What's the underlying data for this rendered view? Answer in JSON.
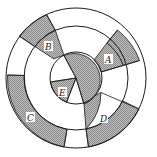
{
  "diagram": {
    "type": "concentric-ring-sector-diagram",
    "center": [
      76,
      78
    ],
    "radii": {
      "outer": 70,
      "middle": 52,
      "inner": 26
    },
    "colors": {
      "shaded": "#a8a8a8",
      "unshaded": "#ffffff",
      "stroke": "#1a1a1a"
    },
    "regions": [
      {
        "id": "A",
        "label": "A",
        "ring": "inner+middle+outer",
        "shaded": true
      },
      {
        "id": "B",
        "label": "B",
        "ring": "middle+outer",
        "shaded": true
      },
      {
        "id": "C",
        "label": "C",
        "ring": "outer",
        "shaded": true
      },
      {
        "id": "D",
        "label": "D",
        "ring": "middle+outer",
        "shaded": true
      },
      {
        "id": "E",
        "label": "E",
        "ring": "inner",
        "shaded": true
      }
    ]
  }
}
